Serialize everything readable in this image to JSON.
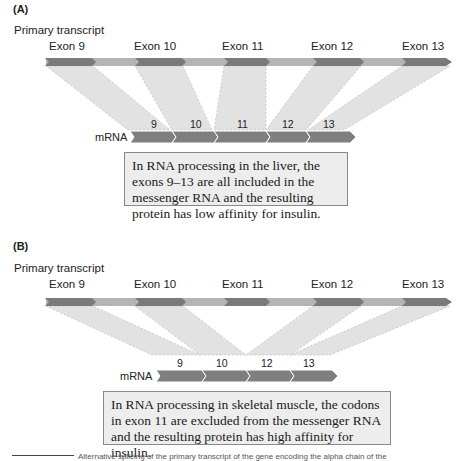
{
  "panel_a": {
    "label": "(A)",
    "transcript_label": "Primary transcript",
    "exons": [
      "Exon 9",
      "Exon 10",
      "Exon 11",
      "Exon 12",
      "Exon 13"
    ],
    "mrna_label": "mRNA",
    "mrna_exons": [
      "9",
      "10",
      "11",
      "12",
      "13"
    ],
    "note": "In RNA processing in the liver, the exons 9–13 are all included in the messenger RNA and the resulting protein has low affinity for insulin."
  },
  "panel_b": {
    "label": "(B)",
    "transcript_label": "Primary transcript",
    "exons": [
      "Exon 9",
      "Exon 10",
      "Exon 11",
      "Exon 12",
      "Exon 13"
    ],
    "mrna_label": "mRNA",
    "mrna_exons": [
      "9",
      "10",
      "12",
      "13"
    ],
    "note": "In RNA processing in skeletal muscle, the codons in exon 11 are excluded from the messenger RNA and the resulting protein has high affinity for insulin."
  },
  "caption": "Alternative splicing of the primary transcript of the gene encoding the alpha chain of the",
  "colors": {
    "exon": "#7d7d7d",
    "intron": "#b4b4b4",
    "projection": "#e0e0e0",
    "note_bg": "#ededed"
  }
}
